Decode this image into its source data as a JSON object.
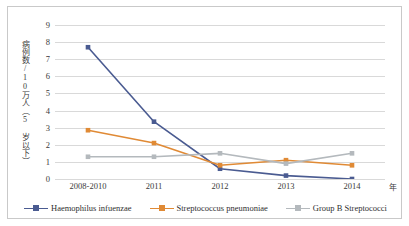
{
  "chart_data": {
    "type": "line",
    "title": "",
    "xlabel": "年",
    "ylabel": "病例数/10万人（5 岁以下）",
    "categories": [
      "2008-2010",
      "2011",
      "2012",
      "2013",
      "2014"
    ],
    "ylim": [
      0,
      9
    ],
    "yticks": [
      0,
      1,
      2,
      3,
      4,
      5,
      6,
      7,
      8,
      9
    ],
    "grid": true,
    "legend_position": "bottom",
    "series": [
      {
        "name": "Haemophilus infuenzae",
        "color": "#4a5b91",
        "marker": "square",
        "values": [
          7.7,
          3.35,
          0.6,
          0.2,
          0.0
        ]
      },
      {
        "name": "Streptococcus pneumoniae",
        "color": "#e08a35",
        "marker": "square",
        "values": [
          2.85,
          2.1,
          0.8,
          1.1,
          0.8
        ]
      },
      {
        "name": "Group B Streptococci",
        "color": "#b4b9bd",
        "marker": "square",
        "values": [
          1.3,
          1.3,
          1.5,
          0.9,
          1.5
        ]
      }
    ]
  },
  "axis": {
    "y_tick_labels": [
      "9",
      "8",
      "7",
      "6",
      "5",
      "4",
      "3",
      "2",
      "1",
      "0"
    ],
    "x_tick_labels": [
      "2008-2010",
      "2011",
      "2012",
      "2013",
      "2014"
    ],
    "x_axis_title": "年",
    "y_axis_title": "病例数/10万人（5 岁以下）"
  },
  "legend": {
    "items": [
      {
        "label": "Haemophilus infuenzae",
        "color": "#4a5b91"
      },
      {
        "label": "Streptococcus pneumoniae",
        "color": "#e08a35"
      },
      {
        "label": "Group B Streptococci",
        "color": "#b4b9bd"
      }
    ]
  }
}
